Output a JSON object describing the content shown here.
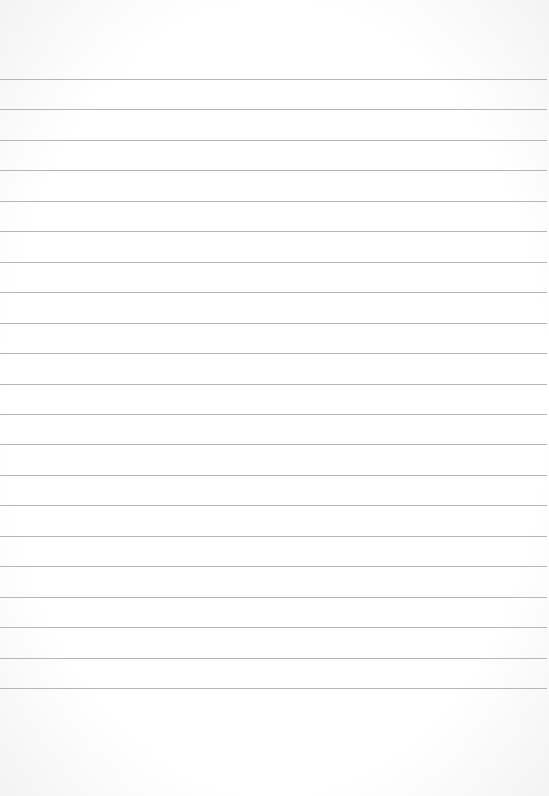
{
  "page": {
    "type": "lined-paper",
    "background_color": "#ffffff",
    "rule_color": "#a9a9a9",
    "rule_count": 21,
    "first_rule_y": 79,
    "rule_spacing": 30.45,
    "text_content": ""
  }
}
